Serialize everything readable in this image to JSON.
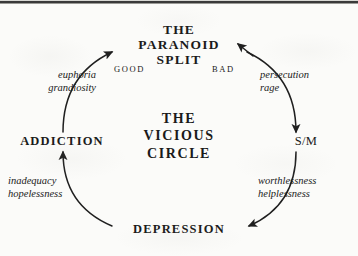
{
  "figure": {
    "center_title_lines": [
      "THE",
      "VICIOUS",
      "CIRCLE"
    ],
    "center_title_line1": "THE",
    "center_title_line2": "VICIOUS",
    "center_title_line3": "CIRCLE",
    "ink_color": "#1a1a1a",
    "background_color": "#fbfbf9"
  },
  "nodes": {
    "paranoid_split": {
      "line1": "THE",
      "line2": "PARANOID",
      "line3": "SPLIT"
    },
    "addiction": {
      "label": "ADDICTION"
    },
    "sm": {
      "label": "S/M"
    },
    "depression": {
      "label": "DEPRESSION"
    }
  },
  "polarity_labels": {
    "good": "GOOD",
    "bad": "BAD"
  },
  "affect_labels": {
    "top_left": {
      "line1": "euphoria",
      "line2": "grandiosity"
    },
    "top_right": {
      "line1": "persecution",
      "line2": "rage"
    },
    "bottom_left": {
      "line1": "inadequacy",
      "line2": "hopelessness"
    },
    "bottom_right": {
      "line1": "worthlessness",
      "line2": "helplessness"
    }
  },
  "arcs": [
    {
      "name": "addiction-to-paranoid-split",
      "from": "ADDICTION",
      "to": "THE PARANOID SPLIT",
      "affect": "euphoria / grandiosity",
      "polarity": "GOOD"
    },
    {
      "name": "paranoid-split-to-sm",
      "from": "THE PARANOID SPLIT",
      "to": "S/M",
      "affect": "persecution / rage",
      "polarity": "BAD"
    },
    {
      "name": "sm-to-depression",
      "from": "S/M",
      "to": "DEPRESSION",
      "affect": "worthlessness / helplessness",
      "polarity": ""
    },
    {
      "name": "depression-to-addiction",
      "from": "DEPRESSION",
      "to": "ADDICTION",
      "affect": "inadequacy / hopelessness",
      "polarity": ""
    }
  ]
}
